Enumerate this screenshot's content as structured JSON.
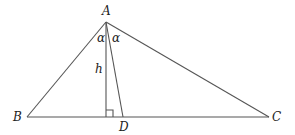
{
  "diagram": {
    "type": "triangle",
    "labels": {
      "A": "A",
      "B": "B",
      "C": "C",
      "D": "D",
      "h": "h",
      "alpha_left": "α",
      "alpha_right": "α"
    },
    "points": {
      "A": [
        106,
        22
      ],
      "B": [
        27,
        117
      ],
      "C": [
        269,
        117
      ],
      "H": [
        106,
        117
      ],
      "D": [
        123,
        117
      ]
    },
    "segments": [
      "AB",
      "AC",
      "BC",
      "AH (altitude h)",
      "AD (angle bisector)"
    ],
    "annotations": [
      "right angle at foot of altitude",
      "angle BAH = α",
      "angle HAD = α"
    ],
    "line_color": "#555555"
  }
}
